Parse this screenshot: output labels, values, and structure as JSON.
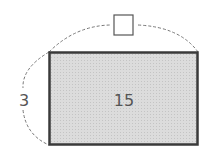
{
  "diagram": {
    "rectangle": {
      "area_label": "15",
      "fill": "#d9d9d9",
      "stroke": "#3a3a3a"
    },
    "height_label": "3",
    "width_label": "",
    "unknown_box": {
      "description": "empty answer box for unknown width"
    },
    "arc_color": "#777777"
  }
}
